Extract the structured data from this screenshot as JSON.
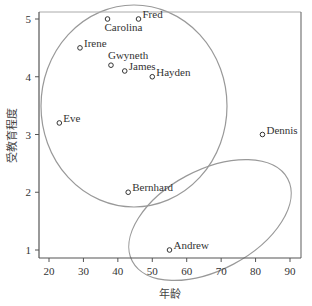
{
  "chart_data": {
    "type": "scatter",
    "title": "",
    "xlabel": "年龄",
    "ylabel": "受教育程度",
    "xlim": [
      17,
      93
    ],
    "ylim": [
      0.85,
      5.12
    ],
    "xticks": [
      20,
      30,
      40,
      50,
      60,
      70,
      80,
      90
    ],
    "yticks": [
      1,
      2,
      3,
      4,
      5
    ],
    "grid": false,
    "legend": null,
    "points": [
      {
        "name": "Carolina",
        "x": 37,
        "y": 5.0,
        "label_pos": "below"
      },
      {
        "name": "Fred",
        "x": 46,
        "y": 5.0,
        "label_pos": "right"
      },
      {
        "name": "Irene",
        "x": 29,
        "y": 4.5,
        "label_pos": "right"
      },
      {
        "name": "Gwyneth",
        "x": 38,
        "y": 4.2,
        "label_pos": "above"
      },
      {
        "name": "James",
        "x": 42,
        "y": 4.1,
        "label_pos": "right"
      },
      {
        "name": "Hayden",
        "x": 50,
        "y": 4.0,
        "label_pos": "right"
      },
      {
        "name": "Eve",
        "x": 23,
        "y": 3.2,
        "label_pos": "right"
      },
      {
        "name": "Dennis",
        "x": 82,
        "y": 3.0,
        "label_pos": "right"
      },
      {
        "name": "Bernhard",
        "x": 43,
        "y": 2.0,
        "label_pos": "right"
      },
      {
        "name": "Andrew",
        "x": 55,
        "y": 1.0,
        "label_pos": "right"
      }
    ],
    "annotations": [
      {
        "type": "ellipse",
        "description": "cluster of younger, more educated people",
        "members": [
          "Carolina",
          "Fred",
          "Irene",
          "Gwyneth",
          "James",
          "Hayden",
          "Eve"
        ]
      },
      {
        "type": "ellipse",
        "description": "cluster of older, less educated people (tilted)",
        "members": [
          "Dennis",
          "Bernhard",
          "Andrew"
        ]
      }
    ]
  },
  "colors": {
    "axis": "#555555",
    "points": "#333333",
    "ellipses": "#999999"
  }
}
